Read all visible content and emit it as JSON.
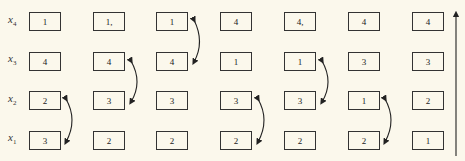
{
  "row_labels": [
    {
      "var": "x",
      "sub": "4"
    },
    {
      "var": "x",
      "sub": "3"
    },
    {
      "var": "x",
      "sub": "2"
    },
    {
      "var": "x",
      "sub": "1"
    }
  ],
  "columns": [
    {
      "values": [
        "1",
        "4",
        "2",
        "3"
      ]
    },
    {
      "values": [
        "1,",
        "4",
        "3",
        "2"
      ]
    },
    {
      "values": [
        "1",
        "4",
        "3",
        "2"
      ]
    },
    {
      "values": [
        "4",
        "1",
        "3",
        "2"
      ]
    },
    {
      "values": [
        "4,",
        "1",
        "3",
        "2"
      ]
    },
    {
      "values": [
        "4",
        "3",
        "1",
        "2"
      ]
    },
    {
      "values": [
        "4",
        "3",
        "2",
        "1"
      ]
    }
  ],
  "swaps": [
    {
      "after_column": 1,
      "rows": [
        "x2",
        "x1"
      ]
    },
    {
      "after_column": 2,
      "rows": [
        "x3",
        "x2"
      ]
    },
    {
      "after_column": 3,
      "rows": [
        "x4",
        "x3"
      ]
    },
    {
      "after_column": 4,
      "rows": [
        "x2",
        "x1"
      ]
    },
    {
      "after_column": 5,
      "rows": [
        "x3",
        "x2"
      ]
    },
    {
      "after_column": 6,
      "rows": [
        "x2",
        "x1"
      ]
    }
  ],
  "direction_arrow": "up-arrow"
}
